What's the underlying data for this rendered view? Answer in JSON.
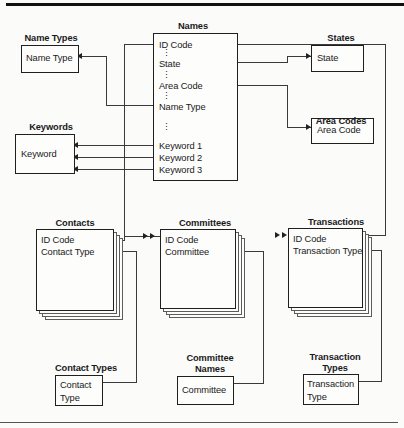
{
  "diagram": {
    "entities": {
      "name_types": {
        "caption": "Name Types",
        "fields": [
          "Name Type"
        ]
      },
      "keywords": {
        "caption": "Keywords",
        "fields": [
          "Keyword"
        ]
      },
      "names": {
        "caption": "Names",
        "fields": [
          "ID Code",
          "State",
          "Area Code",
          "Name Type",
          "Keyword 1",
          "Keyword 2",
          "Keyword 3"
        ]
      },
      "states": {
        "caption": "States",
        "fields": [
          "State"
        ]
      },
      "area_codes": {
        "caption": "Area Codes",
        "fields": [
          "Area Code"
        ]
      },
      "contacts": {
        "caption": "Contacts",
        "fields": [
          "ID Code",
          "Contact Type"
        ]
      },
      "committees": {
        "caption": "Committees",
        "fields": [
          "ID Code",
          "Committee"
        ]
      },
      "transactions": {
        "caption": "Transactions",
        "fields": [
          "ID Code",
          "Transaction Type"
        ]
      },
      "contact_types": {
        "caption": "Contact Types",
        "fields": [
          "Contact",
          "Type"
        ]
      },
      "committee_names": {
        "caption": "Committee Names",
        "caption_line1": "Committee",
        "caption_line2": "Names",
        "fields": [
          "Committee"
        ]
      },
      "transaction_types": {
        "caption": "Transaction Types",
        "caption_line1": "Transaction",
        "caption_line2": "Types",
        "fields": [
          "Transaction",
          "Type"
        ]
      }
    },
    "ellipsis": "⋮",
    "colors": {
      "ink": "#1f1f1f",
      "line": "#3a3a3a",
      "background": "#fbfbfa"
    }
  }
}
